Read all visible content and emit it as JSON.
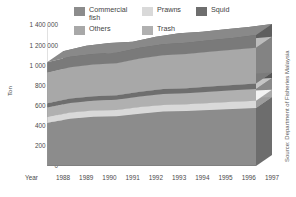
{
  "chart_data": {
    "type": "area",
    "title": "",
    "subtitle": "",
    "xlabel": "Year",
    "ylabel": "Ton",
    "stacked": true,
    "grid": false,
    "legend_position": "top",
    "source_note": "Source: Department of Fisheries Malaysia",
    "categories": [
      "1988",
      "1989",
      "1990",
      "1991",
      "1992",
      "1993",
      "1994",
      "1995",
      "1996",
      "1997"
    ],
    "ylim": [
      0,
      1400000
    ],
    "yticks": [
      0,
      200000,
      400000,
      600000,
      800000,
      1000000,
      1200000,
      1400000
    ],
    "ytick_labels": [
      "0",
      "200 000",
      "400 000",
      "600 000",
      "800 000",
      "1 000 000",
      "1 200 000",
      "1 400 000"
    ],
    "series": [
      {
        "name": "Commercial fish",
        "color": "#8c8c8c",
        "values": [
          430000,
          470000,
          490000,
          495000,
          520000,
          540000,
          545000,
          555000,
          565000,
          575000
        ]
      },
      {
        "name": "Prawns",
        "color": "#d9d9d9",
        "values": [
          55000,
          60000,
          60000,
          62000,
          65000,
          66000,
          68000,
          70000,
          72000,
          74000
        ]
      },
      {
        "name": "Trash",
        "color": "#b0b0b0",
        "values": [
          95000,
          95000,
          98000,
          100000,
          105000,
          108000,
          110000,
          112000,
          114000,
          116000
        ]
      },
      {
        "name": "Squid",
        "color": "#6e6e6e",
        "values": [
          42000,
          44000,
          44000,
          45000,
          48000,
          50000,
          50000,
          52000,
          53000,
          55000
        ]
      },
      {
        "name": "Others",
        "color": "#a8a8a8",
        "values": [
          305000,
          312000,
          315000,
          318000,
          330000,
          336000,
          340000,
          345000,
          350000,
          355000
        ]
      },
      {
        "name": "Top layer",
        "color": "#7a7a7a",
        "values": [
          103000,
          104000,
          105000,
          105000,
          107000,
          110000,
          112000,
          114000,
          116000,
          125000
        ]
      }
    ],
    "totals": [
      1030000,
      1085000,
      1112000,
      1125000,
      1175000,
      1210000,
      1225000,
      1248000,
      1270000,
      1300000
    ]
  },
  "legend": {
    "items": [
      {
        "label": "Commercial\nfish",
        "color": "#8c8c8c",
        "swatch_name": "legend-swatch-commercial-fish"
      },
      {
        "label": "Prawns",
        "color": "#d9d9d9",
        "swatch_name": "legend-swatch-prawns"
      },
      {
        "label": "Squid",
        "color": "#6e6e6e",
        "swatch_name": "legend-swatch-squid"
      },
      {
        "label": "Others",
        "color": "#a8a8a8",
        "swatch_name": "legend-swatch-others"
      },
      {
        "label": "Trash",
        "color": "#b0b0b0",
        "swatch_name": "legend-swatch-trash"
      }
    ]
  },
  "axes": {
    "y_title": "Ton",
    "x_title": "Year",
    "y_labels": [
      "1 400 000",
      "1 200 000",
      "1 000 000",
      "800 000",
      "600 000",
      "400 000",
      "200 000",
      "0"
    ],
    "x_labels": [
      "1988",
      "1989",
      "1990",
      "1991",
      "1992",
      "1993",
      "1994",
      "1995",
      "1996",
      "1997"
    ]
  },
  "source": {
    "text": "Source: Department of Fisheries Malaysia"
  },
  "colors": {
    "background": "#ffffff",
    "text": "#4a4a4a",
    "plot_face": "#ffffff",
    "side_wall": "#cfcfcf",
    "top_edge": "#e4e4e4"
  }
}
